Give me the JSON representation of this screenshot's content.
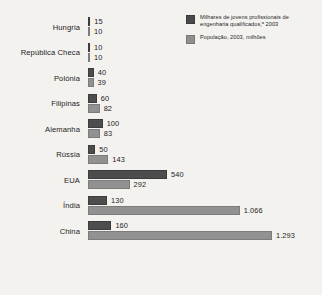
{
  "legend": {
    "entries": [
      {
        "swatch": "dark",
        "color": "#4a4a4a",
        "label": "Milhares de jovens profissionais de engenharia qualificados,ᵃ 2003"
      },
      {
        "swatch": "light",
        "color": "#8f8f8f",
        "label": "População, 2003, milhões"
      }
    ]
  },
  "chart_data": {
    "type": "bar",
    "orientation": "horizontal",
    "title": "",
    "xlabel": "",
    "ylabel": "",
    "grid": false,
    "legend_position": "top-right",
    "categories": [
      "Hungria",
      "República Checa",
      "Polónia",
      "Filipinas",
      "Alemanha",
      "Rússia",
      "EUA",
      "Índia",
      "China"
    ],
    "series": [
      {
        "name": "Milhares de jovens profissionais de engenharia qualificados,ᵃ 2003",
        "color": "#4a4a4a",
        "values": [
          15,
          10,
          40,
          60,
          100,
          50,
          540,
          130,
          160
        ],
        "labels": [
          "15",
          "10",
          "40",
          "60",
          "100",
          "50",
          "540",
          "130",
          "160"
        ],
        "max": 540
      },
      {
        "name": "População, 2003, milhões",
        "color": "#8f8f8f",
        "values": [
          10,
          10,
          39,
          82,
          83,
          143,
          292,
          1066,
          1293
        ],
        "labels": [
          "10",
          "10",
          "39",
          "82",
          "83",
          "143",
          "292",
          "1.066",
          "1.293"
        ],
        "max": 1293
      }
    ],
    "rows": [
      {
        "category": "Hungria",
        "engineers": 15,
        "engineers_label": "15",
        "population": 10,
        "population_label": "10"
      },
      {
        "category": "República Checa",
        "engineers": 10,
        "engineers_label": "10",
        "population": 10,
        "population_label": "10"
      },
      {
        "category": "Polónia",
        "engineers": 40,
        "engineers_label": "40",
        "population": 39,
        "population_label": "39"
      },
      {
        "category": "Filipinas",
        "engineers": 60,
        "engineers_label": "60",
        "population": 82,
        "population_label": "82"
      },
      {
        "category": "Alemanha",
        "engineers": 100,
        "engineers_label": "100",
        "population": 83,
        "population_label": "83"
      },
      {
        "category": "Rússia",
        "engineers": 50,
        "engineers_label": "50",
        "population": 143,
        "population_label": "143"
      },
      {
        "category": "EUA",
        "engineers": 540,
        "engineers_label": "540",
        "population": 292,
        "population_label": "292"
      },
      {
        "category": "Índia",
        "engineers": 130,
        "engineers_label": "130",
        "population": 1066,
        "population_label": "1.066"
      },
      {
        "category": "China",
        "engineers": 160,
        "engineers_label": "160",
        "population": 1293,
        "population_label": "1.293"
      }
    ]
  }
}
